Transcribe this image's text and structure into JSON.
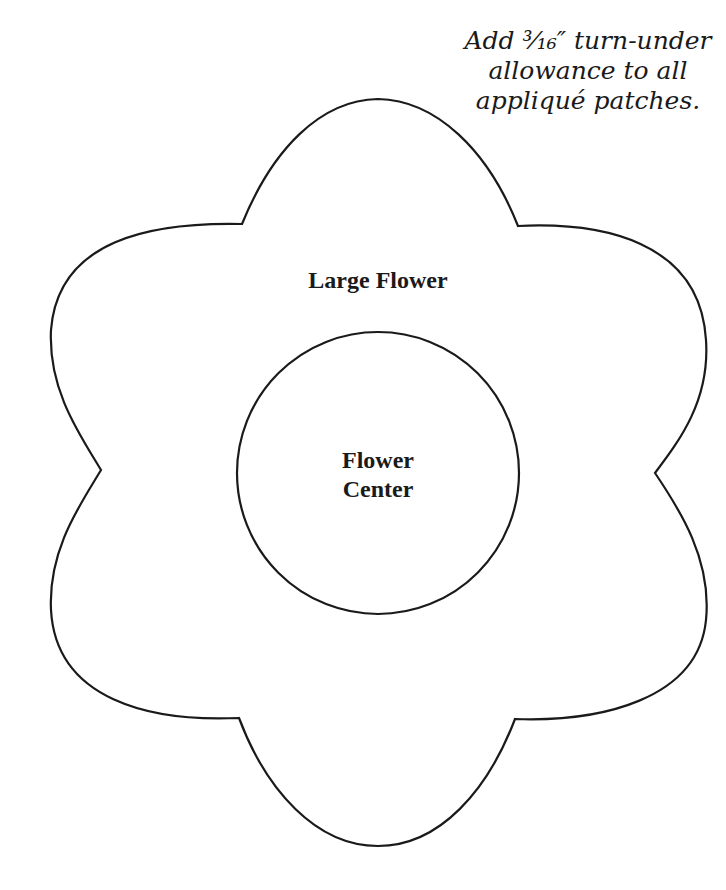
{
  "note": {
    "lines": [
      "Add ³⁄₁₆″ turn-under",
      "allowance to all",
      "appliqué patches."
    ]
  },
  "shapes": {
    "large_flower": {
      "label": "Large Flower"
    },
    "flower_center": {
      "label_lines": [
        "Flower",
        "Center"
      ]
    }
  },
  "colors": {
    "stroke": "#1a1a1a",
    "background": "#ffffff"
  }
}
